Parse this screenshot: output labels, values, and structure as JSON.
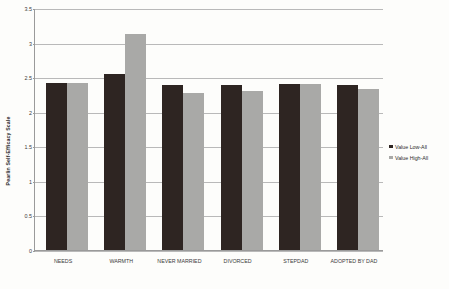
{
  "chart_data": {
    "type": "bar",
    "title": "",
    "xlabel": "",
    "ylabel": "Pearlin Self-Efficacy Scale",
    "ylim": [
      0,
      3.5
    ],
    "grid": true,
    "legend_position": "right",
    "categories": [
      "NEEDS",
      "WARMTH",
      "NEVER MARRIED",
      "DIVORCED",
      "STEPDAD",
      "ADOPTED BY DAD"
    ],
    "ytick_labels": [
      "3.5",
      "3",
      "2.5",
      "2",
      "1.5",
      "1",
      "0.5",
      "0"
    ],
    "ytick_values": [
      3.5,
      3,
      2.5,
      2,
      1.5,
      1,
      0.5,
      0
    ],
    "series": [
      {
        "name": "Value Low-All",
        "color": "#2e2522",
        "values": [
          2.41,
          2.54,
          2.39,
          2.38,
          2.4,
          2.38
        ]
      },
      {
        "name": "Value High-All",
        "color": "#a9a9a7",
        "values": [
          2.42,
          3.12,
          2.27,
          2.3,
          2.4,
          2.33
        ]
      }
    ]
  },
  "legend": {
    "items": [
      {
        "label": "Value Low-All",
        "color": "#2e2522"
      },
      {
        "label": "Value High-All",
        "color": "#a9a9a7"
      }
    ]
  }
}
